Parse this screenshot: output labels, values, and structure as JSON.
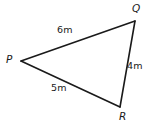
{
  "figure": {
    "kind": "geometry-diagram",
    "shape": "triangle",
    "width": 150,
    "height": 128,
    "background_color": "#ffffff",
    "stroke_color": "#1a1a1a",
    "stroke_width": 1.6,
    "text_color": "#1a1a1a"
  },
  "vertices": [
    {
      "id": "P",
      "label": "P",
      "x": 21,
      "y": 61,
      "label_x": 6,
      "label_y": 54
    },
    {
      "id": "Q",
      "label": "Q",
      "x": 135,
      "y": 21,
      "label_x": 132,
      "label_y": 3
    },
    {
      "id": "R",
      "label": "R",
      "x": 120,
      "y": 107,
      "label_x": 119,
      "label_y": 111
    }
  ],
  "sides": [
    {
      "id": "PQ",
      "from": "P",
      "to": "Q",
      "label": "6m",
      "value": 6,
      "unit": "m",
      "label_x": 57,
      "label_y": 25
    },
    {
      "id": "QR",
      "from": "Q",
      "to": "R",
      "label": "4m",
      "value": 4,
      "unit": "m",
      "label_x": 127,
      "label_y": 61
    },
    {
      "id": "PR",
      "from": "P",
      "to": "R",
      "label": "5m",
      "value": 5,
      "unit": "m",
      "label_x": 51,
      "label_y": 83
    }
  ],
  "chart_data": {
    "type": "diagram",
    "title": "",
    "categories": [
      "PQ",
      "QR",
      "PR"
    ],
    "values": [
      6,
      4,
      5
    ],
    "unit": "m",
    "labels": [
      "6m",
      "4m",
      "5m"
    ],
    "vertex_labels": [
      "P",
      "Q",
      "R"
    ]
  }
}
